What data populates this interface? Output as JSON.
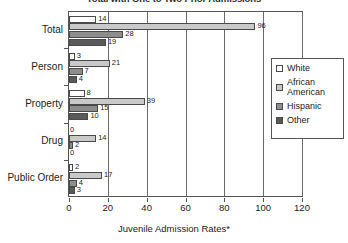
{
  "chart_data": {
    "type": "bar",
    "orientation": "horizontal",
    "title": "Total with One to Two Prior Admissions",
    "xlabel": "Juvenile Admission Rates*",
    "ylabel": "",
    "categories": [
      "Total",
      "Person",
      "Property",
      "Drug",
      "Public Order"
    ],
    "series": [
      {
        "name": "White",
        "color": "#ffffff",
        "values": [
          14,
          3,
          8,
          0,
          2
        ]
      },
      {
        "name": "African American",
        "color": "#c9c9c9",
        "values": [
          96,
          21,
          39,
          14,
          17
        ]
      },
      {
        "name": "Hispanic",
        "color": "#8d8d8d",
        "values": [
          28,
          7,
          15,
          2,
          4
        ]
      },
      {
        "name": "Other",
        "color": "#5a5a5a",
        "values": [
          19,
          4,
          10,
          0,
          3
        ]
      }
    ],
    "xlim": [
      0,
      120
    ],
    "xticks": [
      0,
      20,
      40,
      60,
      80,
      100,
      120
    ],
    "xtick_labels": [
      "0",
      "20",
      "40",
      "60",
      "80",
      "100",
      "120"
    ],
    "grid": "vertical",
    "legend_position": "right",
    "data_labels": true
  },
  "legend": {
    "items": [
      {
        "label": "White",
        "swatch": "white-swatch"
      },
      {
        "label": "African\nAmerican",
        "swatch": "african-american-swatch"
      },
      {
        "label": "Hispanic",
        "swatch": "hispanic-swatch"
      },
      {
        "label": "Other",
        "swatch": "other-swatch"
      }
    ]
  }
}
